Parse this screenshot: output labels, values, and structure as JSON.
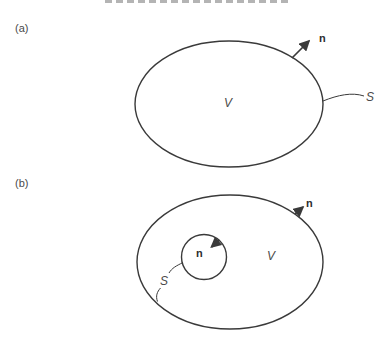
{
  "window": {
    "width": 390,
    "height": 343,
    "background": "#ffffff"
  },
  "colors": {
    "line": "#3a3a3a",
    "label": "#4a4a4a",
    "strip": "#9b9b9b"
  },
  "figure": {
    "panels": [
      {
        "tag": "(a)",
        "volume_label": "V",
        "surface_label": "S",
        "normal_label": "n"
      },
      {
        "tag": "(b)",
        "volume_label": "V",
        "surface_label": "S",
        "outer_normal_label": "n",
        "inner_normal_label": "n"
      }
    ]
  }
}
